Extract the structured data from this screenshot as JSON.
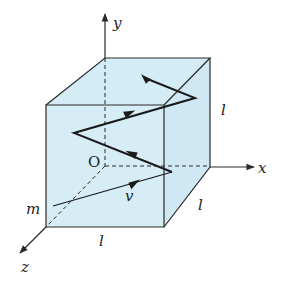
{
  "diagram": {
    "colors": {
      "cube_fill": "#d4ecf5",
      "edge": "#2a2a2a",
      "path": "#1a1a1a",
      "background": "#ffffff"
    },
    "axes": {
      "x_label": "x",
      "y_label": "y",
      "z_label": "z",
      "origin_label": "O"
    },
    "labels": {
      "particle": "m",
      "velocity": "v",
      "edge_right_vertical": "l",
      "edge_right_depth": "l",
      "edge_bottom_front": "l"
    }
  }
}
